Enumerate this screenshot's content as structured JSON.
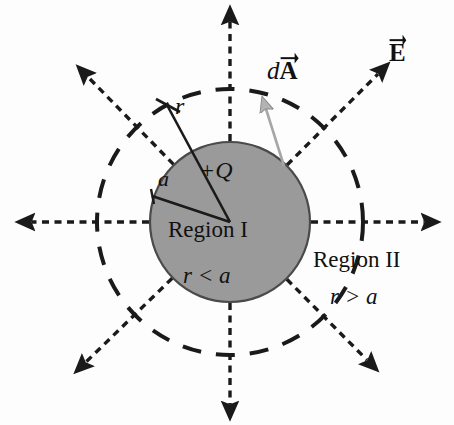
{
  "figure": {
    "colors": {
      "sphere_fill": "#9a9a9a",
      "sphere_stroke": "#3a3a3a",
      "field_line": "#1a1a1a",
      "gaussian_circle": "#1a1a1a",
      "dA_arrow": "#a6a6a6",
      "background": "#fdfdfd",
      "text": "#111111"
    },
    "geometry": {
      "center_x": 230,
      "center_y": 222,
      "sphere_radius": 80,
      "gaussian_radius": 133,
      "field_line_count": 8
    },
    "labels": {
      "dA_prefix": "d",
      "dA_vector": "A",
      "E_vector": "E",
      "radius_r": "r",
      "radius_a": "a",
      "charge": "+Q",
      "region_one": "Region I",
      "region_one_condition": "r < a",
      "region_two": "Region II",
      "region_two_condition": "r > a"
    }
  }
}
